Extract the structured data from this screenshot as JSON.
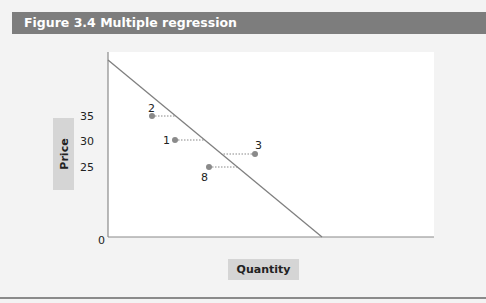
{
  "figure": {
    "title": "Figure 3.4  Multiple regression"
  },
  "chart_data": {
    "type": "scatter",
    "title": "Figure 3.4  Multiple regression",
    "xlabel": "Quantity",
    "ylabel": "Price",
    "y_ticks": [
      "35",
      "30",
      "25"
    ],
    "origin_label": "0",
    "regression_line": {
      "description": "downward-sloping demand/regression line from top of y-axis to x-axis"
    },
    "points": [
      {
        "label": "2",
        "price": 35,
        "residual_direction": "below line (left)"
      },
      {
        "label": "1",
        "price": 31,
        "residual_direction": "below line (left)"
      },
      {
        "label": "3",
        "price": 29,
        "residual_direction": "above line (right)"
      },
      {
        "label": "8",
        "price": 26,
        "residual_direction": "below line (left)"
      }
    ],
    "grid": false,
    "legend": "none"
  }
}
